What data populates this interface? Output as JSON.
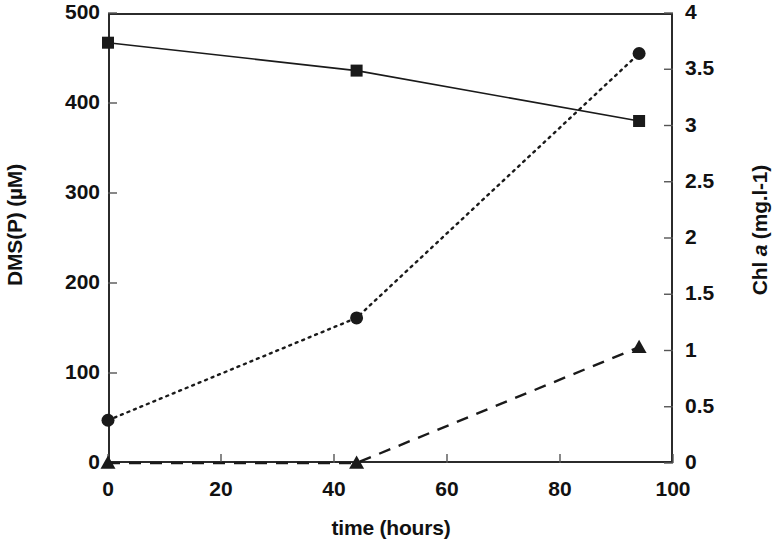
{
  "chart_data": {
    "type": "line",
    "title": "",
    "xlabel": "time (hours)",
    "ylabel": "DMS(P) (µM)",
    "ylabel_right_prefix": "Chl ",
    "ylabel_right_italic": "a",
    "ylabel_right_suffix": " (mg.l-1)",
    "grid": false,
    "legend": "none",
    "xlim": [
      0,
      100
    ],
    "xticks": [
      0,
      20,
      40,
      60,
      80,
      100
    ],
    "xtick_labels": [
      "0",
      "20",
      "40",
      "60",
      "80",
      "100"
    ],
    "ylim": [
      0,
      500
    ],
    "yticks": [
      0,
      100,
      200,
      300,
      400,
      500
    ],
    "ytick_labels": [
      "0",
      "100",
      "200",
      "300",
      "400",
      "500"
    ],
    "ylim_right": [
      0,
      4
    ],
    "yticks_right": [
      0,
      0.5,
      1,
      1.5,
      2,
      2.5,
      3,
      3.5,
      4
    ],
    "ytick_labels_right": [
      "0",
      "0.5",
      "1",
      "1.5",
      "2",
      "2.5",
      "3",
      "3.5",
      "4"
    ],
    "series": [
      {
        "name": "DMS(P)",
        "axis": "left",
        "marker": "square",
        "linestyle": "solid",
        "color": "#1a1a1a",
        "x": [
          0,
          44,
          94
        ],
        "values": [
          467,
          436,
          380
        ]
      },
      {
        "name": "Chl a",
        "axis": "right",
        "marker": "circle",
        "linestyle": "dotted",
        "color": "#1a1a1a",
        "x": [
          0,
          44,
          94
        ],
        "values": [
          0.38,
          1.29,
          3.64
        ]
      },
      {
        "name": "DMS",
        "axis": "right",
        "marker": "triangle",
        "linestyle": "dashed",
        "color": "#1a1a1a",
        "x": [
          0,
          44,
          94
        ],
        "values": [
          0,
          0,
          1.03
        ]
      }
    ]
  },
  "axes": {
    "left_title": "DMS(P) (µM)",
    "x_title": "time (hours)",
    "right_title_pre": "Chl ",
    "right_title_em": "a",
    "right_title_post": " (mg.l-1)"
  }
}
